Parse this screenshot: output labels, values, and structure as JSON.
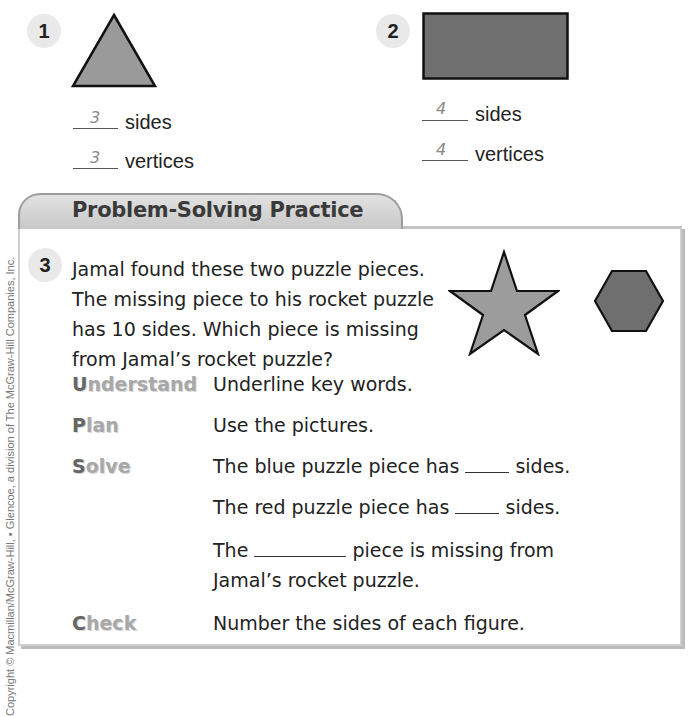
{
  "exercises": [
    {
      "number": "1",
      "shape": "triangle",
      "shape_color": "#9a9a9a",
      "answers": [
        {
          "value": "3",
          "label": "sides"
        },
        {
          "value": "3",
          "label": "vertices"
        }
      ]
    },
    {
      "number": "2",
      "shape": "rectangle",
      "shape_color": "#6f6f6f",
      "answers": [
        {
          "value": "4",
          "label": "sides"
        },
        {
          "value": "4",
          "label": "vertices"
        }
      ]
    }
  ],
  "problem_section": {
    "title": "Problem-Solving Practice",
    "number": "3",
    "question_lines": [
      "Jamal found these two puzzle pieces.",
      "The missing piece to his rocket puzzle",
      "has 10 sides. Which piece is missing",
      "from Jamal’s rocket puzzle?"
    ],
    "figures": [
      {
        "name": "star",
        "color": "#9c9c9c"
      },
      {
        "name": "hexagon",
        "color": "#6f6f6f"
      }
    ],
    "steps": [
      {
        "label_first": "U",
        "label_rest": "nderstand",
        "text": "Underline key words."
      },
      {
        "label_first": "P",
        "label_rest": "lan",
        "text": "Use the pictures."
      },
      {
        "label_first": "S",
        "label_rest": "olve",
        "lines": [
          {
            "before": "The blue puzzle piece has",
            "after": "sides."
          },
          {
            "before": "The red puzzle piece has",
            "after": "sides."
          },
          {
            "before": "The",
            "after": "piece is missing from",
            "cont": "Jamal’s rocket puzzle."
          }
        ]
      },
      {
        "label_first": "C",
        "label_rest": "heck",
        "text": "Number the sides of each figure."
      }
    ]
  },
  "copyright": "Copyright © Macmillan/McGraw-Hill, • Glencoe, a division of The McGraw-Hill Companies, Inc."
}
